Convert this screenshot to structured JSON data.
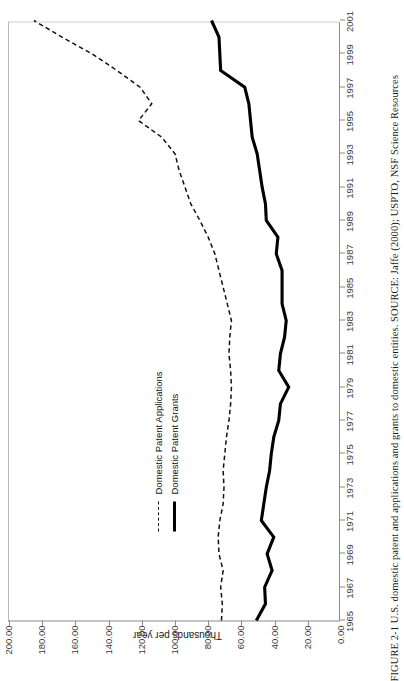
{
  "figure": {
    "caption_number": "FIGURE 2-1",
    "caption_text": "FIGURE 2-1  U.S. domestic patent and applications and grants to domestic entities. SOURCE: Jaffe (2000); USPTO, NSF Science Resources"
  },
  "legend": {
    "items": [
      {
        "label": "Domestic Patent Applications",
        "style": "dashed"
      },
      {
        "label": "Domestic Patent Grants",
        "style": "solid"
      }
    ]
  },
  "axis": {
    "y_label": "Thousands per year",
    "y_ticks": [
      "0.00",
      "20.00",
      "40.00",
      "60.00",
      "80.00",
      "100.00",
      "120.00",
      "140.00",
      "160.00",
      "180.00",
      "200.00"
    ],
    "x_ticks": [
      "1965",
      "1967",
      "1969",
      "1971",
      "1973",
      "1975",
      "1977",
      "1979",
      "1981",
      "1983",
      "1985",
      "1987",
      "1989",
      "1991",
      "1993",
      "1995",
      "1997",
      "1999",
      "2001"
    ]
  },
  "chart_data": {
    "type": "line",
    "title": "U.S. domestic patent and applications and grants to domestic entities",
    "xlabel": "",
    "ylabel": "Thousands per year",
    "ylim": [
      0,
      200
    ],
    "xlim": [
      1965,
      2001
    ],
    "grid": false,
    "legend_position": "center-left",
    "source": "Jaffe (2000); USPTO, NSF Science Resources",
    "x": [
      1965,
      1966,
      1967,
      1968,
      1969,
      1970,
      1971,
      1972,
      1973,
      1974,
      1975,
      1976,
      1977,
      1978,
      1979,
      1980,
      1981,
      1982,
      1983,
      1984,
      1985,
      1986,
      1987,
      1988,
      1989,
      1990,
      1991,
      1992,
      1993,
      1994,
      1995,
      1996,
      1997,
      1998,
      1999,
      2000,
      2001
    ],
    "series": [
      {
        "name": "Domestic Patent Applications",
        "style": "dashed",
        "values": [
          72.0,
          71.5,
          72.5,
          71.0,
          73.5,
          74.0,
          73.0,
          71.0,
          70.5,
          71.0,
          70.0,
          69.0,
          67.5,
          66.5,
          66.0,
          66.5,
          67.5,
          67.0,
          66.0,
          68.5,
          71.0,
          73.5,
          76.0,
          80.0,
          85.0,
          90.5,
          94.0,
          97.5,
          100.0,
          108.0,
          122.0,
          114.0,
          121.0,
          135.0,
          150.0,
          168.0,
          185.0
        ]
      },
      {
        "name": "Domestic Patent Grants",
        "style": "solid",
        "values": [
          51.0,
          45.5,
          46.0,
          41.5,
          44.5,
          40.5,
          48.0,
          46.5,
          45.0,
          43.0,
          42.0,
          40.5,
          37.5,
          36.5,
          31.5,
          37.5,
          36.5,
          34.0,
          33.0,
          35.5,
          35.5,
          35.5,
          39.0,
          38.0,
          45.0,
          45.5,
          47.5,
          49.0,
          50.5,
          53.5,
          54.5,
          55.5,
          58.0,
          72.5,
          73.0,
          73.5,
          78.0
        ]
      }
    ]
  }
}
